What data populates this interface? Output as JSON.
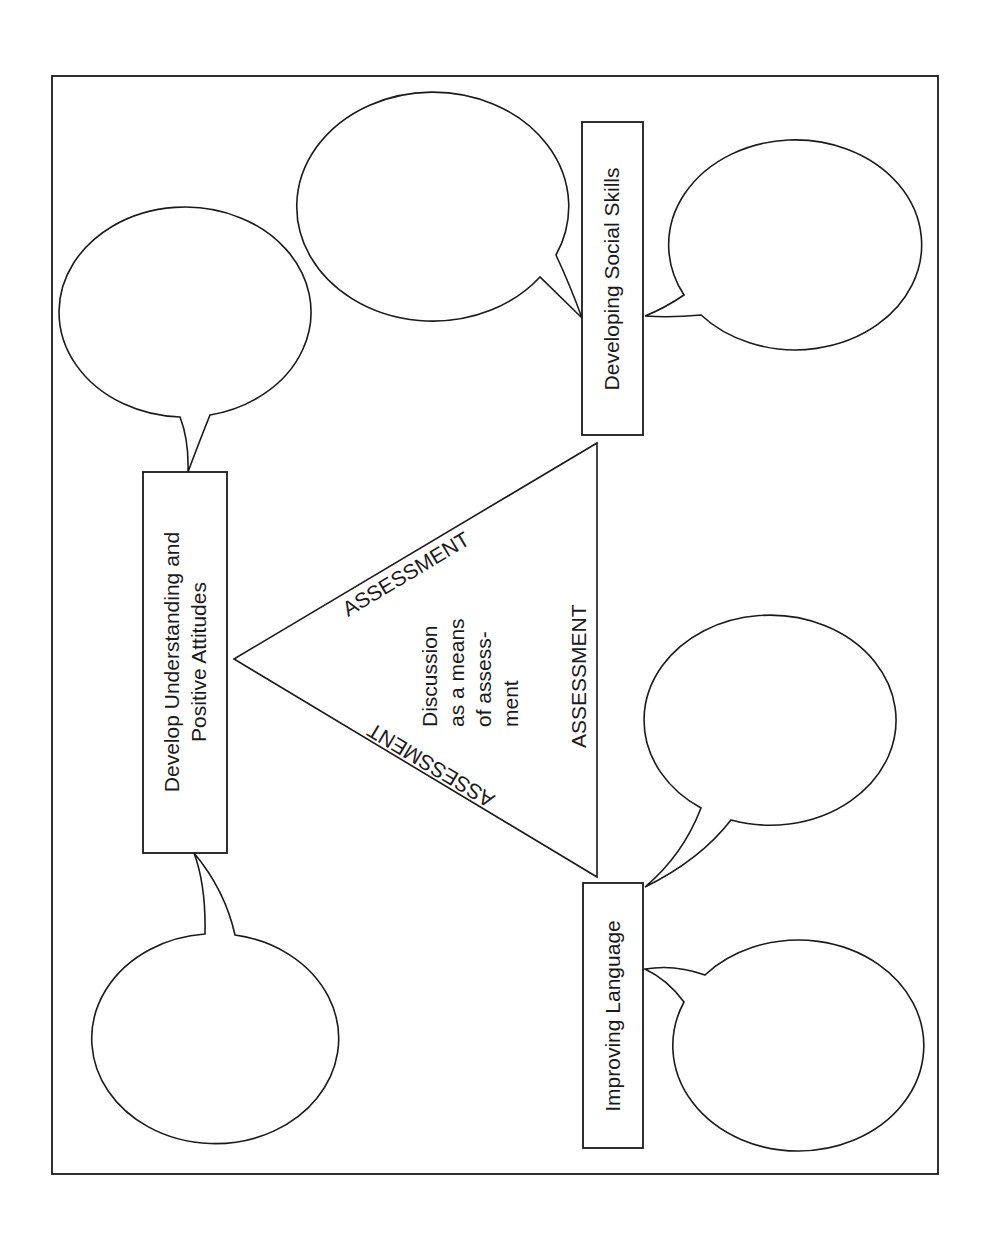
{
  "diagram": {
    "frame": {
      "x": 52,
      "y": 76,
      "width": 886,
      "height": 1098,
      "stroke": "#1a1a1a"
    },
    "center": {
      "shape": "triangle",
      "points": [
        [
          234,
          659
        ],
        [
          597,
          443
        ],
        [
          597,
          877
        ]
      ],
      "lines": [
        "Discussion",
        "as a means",
        "of assess-",
        "ment"
      ],
      "edge_labels": {
        "upper": "ASSESSMENT",
        "right": "ASSESSMENT",
        "lower": "ASSESSMENT"
      }
    },
    "boxes": [
      {
        "id": "understanding",
        "lines": [
          "Develop Understanding and",
          "Positive Attitudes"
        ]
      },
      {
        "id": "social",
        "lines": [
          "Developing Social Skills"
        ]
      },
      {
        "id": "language",
        "lines": [
          "Improving Language"
        ]
      }
    ],
    "bubbles": [
      {
        "id": "bubble-understanding-top",
        "attached_to": "understanding",
        "content": ""
      },
      {
        "id": "bubble-understanding-bottom",
        "attached_to": "understanding",
        "content": ""
      },
      {
        "id": "bubble-social-left",
        "attached_to": "social",
        "content": ""
      },
      {
        "id": "bubble-social-right",
        "attached_to": "social",
        "content": ""
      },
      {
        "id": "bubble-language-upper",
        "attached_to": "language",
        "content": ""
      },
      {
        "id": "bubble-language-lower",
        "attached_to": "language",
        "content": ""
      }
    ],
    "colors": {
      "ink": "#1a1a1a",
      "paper": "#ffffff"
    }
  }
}
